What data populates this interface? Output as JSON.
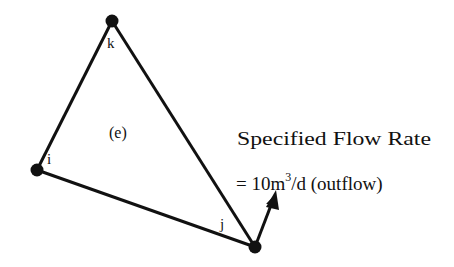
{
  "diagram": {
    "type": "triangular-finite-element",
    "element": {
      "label": "(e)"
    },
    "nodes": [
      {
        "id": "i",
        "label": "i",
        "x": 37,
        "y": 170
      },
      {
        "id": "j",
        "label": "j",
        "x": 255,
        "y": 247
      },
      {
        "id": "k",
        "label": "k",
        "x": 112,
        "y": 21
      }
    ],
    "edges": [
      {
        "from": "k",
        "to": "i"
      },
      {
        "from": "i",
        "to": "j"
      },
      {
        "from": "j",
        "to": "k"
      }
    ],
    "flow_arrow": {
      "at_node": "j",
      "direction": "outward",
      "tip_x": 275,
      "tip_y": 193
    },
    "annotation": {
      "line1": "Specified Flow Rate",
      "line2_prefix": "= 10m",
      "line2_superscript": "3",
      "line2_suffix": "/d (outflow)"
    },
    "colors": {
      "stroke": "#111111",
      "background": "#ffffff"
    }
  }
}
